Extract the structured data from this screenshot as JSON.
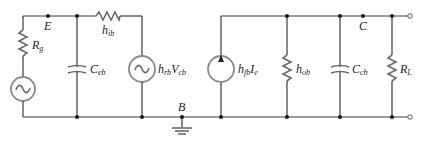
{
  "diagram": {
    "nodes": {
      "E": "E",
      "B": "B",
      "C": "C"
    },
    "labels": {
      "source_resistance": {
        "main": "R",
        "sub": "g"
      },
      "input_impedance": {
        "main": "h",
        "sub": "ib"
      },
      "emitter_base_capacitance": {
        "main": "C",
        "sub": "eb"
      },
      "reverse_voltage_source": {
        "main": "h",
        "sub": "rb",
        "tail_main": "V",
        "tail_sub": "cb"
      },
      "forward_current_source": {
        "main": "h",
        "sub": "fb",
        "tail_main": "I",
        "tail_sub": "e"
      },
      "output_admittance": {
        "main": "h",
        "sub": "ob"
      },
      "collector_base_capacitance": {
        "main": "C",
        "sub": "cb"
      },
      "load_resistance": {
        "main": "R",
        "sub": "L"
      }
    },
    "colors": {
      "wire": "#3a3a3a",
      "component": "#6a6a6a",
      "source_outline": "#8a8a8a"
    }
  }
}
